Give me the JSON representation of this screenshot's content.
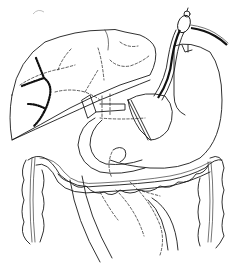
{
  "figure": {
    "kind": "anatomical line drawing",
    "style": "black ink on white",
    "background": "#ffffff",
    "ink": "#1a1a1a",
    "structures": [
      {
        "name": "liver"
      },
      {
        "name": "liver-tumor-infiltration"
      },
      {
        "name": "stomach"
      },
      {
        "name": "duodenum"
      },
      {
        "name": "transverse-colon"
      },
      {
        "name": "ascending-colon"
      },
      {
        "name": "descending-colon"
      },
      {
        "name": "aorta"
      },
      {
        "name": "endoscope"
      },
      {
        "name": "catheter-tube"
      }
    ]
  }
}
